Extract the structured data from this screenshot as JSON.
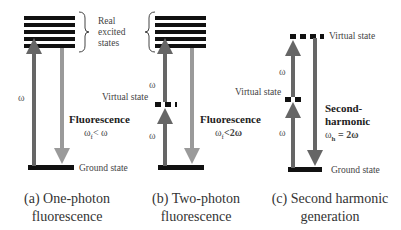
{
  "colors": {
    "level": "#111111",
    "excitation_arrow": "#666666",
    "emission_arrow": "#9a9a9a",
    "shg_arrow": "#666666"
  },
  "panels": [
    {
      "id": "a",
      "brace_label_line1": "Real",
      "brace_label_line2": "excited",
      "brace_label_line3": "states",
      "excitation_label": "ω",
      "process_label": "Fluorescence",
      "relation_label": "ω",
      "relation_sub": "f",
      "relation_rest": "< ω",
      "ground_label": "Ground state",
      "caption_line1": "(a) One-photon",
      "caption_line2": "fluorescence"
    },
    {
      "id": "b",
      "excitation_label_upper": "ω",
      "excitation_label_lower": "ω",
      "virtual_label": "Virtual state",
      "process_label": "Fluorescence",
      "relation_label": "ω",
      "relation_sub": "f",
      "relation_rest": "<2ω",
      "caption_line1": "(b) Two-photon",
      "caption_line2": "fluorescence"
    },
    {
      "id": "c",
      "virtual_label_top": "Virtual state",
      "virtual_label_lower": "Virtual state",
      "excitation_label_upper": "ω",
      "excitation_label_lower": "ω",
      "process_label_line1": "Second-",
      "process_label_line2": "harmonic",
      "relation_label": "ω",
      "relation_sub": "h",
      "relation_rest": " = 2ω",
      "ground_label": "Ground state",
      "caption_line1": "(c) Second harmonic",
      "caption_line2": "generation"
    }
  ]
}
